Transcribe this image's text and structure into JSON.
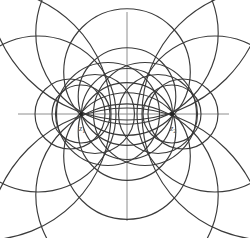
{
  "figure": {
    "background_color": "#ffffff",
    "curve_color": "#3a3a3a",
    "axis_color": "#8e8e8e",
    "node_color": "#222222",
    "label_color": "#4a4a4a",
    "width": 250,
    "height": 238
  },
  "axes": {
    "origin": {
      "x": 127,
      "y": 114
    },
    "horizontal": {
      "x1": 18,
      "y1": 114,
      "x2": 229,
      "y2": 114,
      "label": "real-axis"
    },
    "vertical": {
      "x1": 127,
      "y1": 12,
      "x2": 127,
      "y2": 221,
      "label": "imaginary-axis"
    }
  },
  "points": [
    {
      "id": "z1",
      "label": "z",
      "subscript": "1",
      "x": 81,
      "y": 114,
      "label_x": 79,
      "label_y": 129
    },
    {
      "id": "z2",
      "label": "z",
      "subscript": "2",
      "x": 172,
      "y": 114,
      "label_x": 170,
      "label_y": 129
    }
  ],
  "chart_data": {
    "type": "diagram",
    "limit_points": [
      {
        "name": "z1",
        "x": 81,
        "y": 114
      },
      {
        "name": "z2",
        "x": 172,
        "y": 114
      }
    ],
    "half_distance": 45.5,
    "midpoint": {
      "x": 127,
      "y": 114
    },
    "families": [
      {
        "name": "elliptic-family",
        "note": "Circles passing through both limit points z1 and z2; centers lie on the vertical axis.",
        "circles": [
          {
            "cx": 127,
            "cy": 114,
            "r": 45.5
          },
          {
            "cx": 127,
            "cy": 96.5,
            "r": 48.8
          },
          {
            "cx": 127,
            "cy": 131.5,
            "r": 48.8
          },
          {
            "cx": 127,
            "cy": 72,
            "r": 63.3
          },
          {
            "cx": 127,
            "cy": 156,
            "r": 63.3
          },
          {
            "cx": 127,
            "cy": 33,
            "r": 91.2
          },
          {
            "cx": 127,
            "cy": 195,
            "r": 91.2
          },
          {
            "cx": 127,
            "cy": -20,
            "r": 140.0
          },
          {
            "cx": 127,
            "cy": 248,
            "r": 140.0
          }
        ]
      },
      {
        "name": "hyperbolic-family-left",
        "note": "Circles of Apollonius about z1; centers lie on the horizontal axis, orthogonal to the elliptic family.",
        "circles": [
          {
            "cx": 81,
            "cy": 114,
            "r": 29.0
          },
          {
            "cx": 70,
            "cy": 114,
            "r": 35.0
          },
          {
            "cx": 95,
            "cy": 114,
            "r": 39.5
          },
          {
            "cx": 108,
            "cy": 114,
            "r": 51.5
          }
        ]
      },
      {
        "name": "hyperbolic-family-right",
        "note": "Circles of Apollonius about z2; centers lie on the horizontal axis, orthogonal to the elliptic family.",
        "circles": [
          {
            "cx": 172,
            "cy": 114,
            "r": 29.0
          },
          {
            "cx": 183,
            "cy": 114,
            "r": 35.0
          },
          {
            "cx": 158,
            "cy": 114,
            "r": 39.5
          },
          {
            "cx": 145,
            "cy": 114,
            "r": 51.5
          }
        ]
      },
      {
        "name": "outer-arcs",
        "note": "Large outlying circles of the hyperbolic family, visible only as arcs near the image border.",
        "circles": [
          {
            "cx": 38,
            "cy": 114,
            "r": 78.0
          },
          {
            "cx": 215,
            "cy": 114,
            "r": 78.0
          },
          {
            "cx": -15,
            "cy": 114,
            "r": 126.0
          },
          {
            "cx": 268,
            "cy": 114,
            "r": 126.0
          }
        ]
      }
    ]
  }
}
